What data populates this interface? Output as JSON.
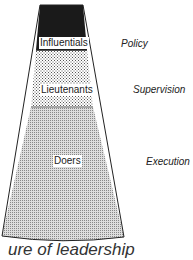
{
  "diagram": {
    "tiers": [
      {
        "label": "Influentials",
        "role": "Policy",
        "fill": "#1a1a1a"
      },
      {
        "label": "Lieutenants",
        "role": "Supervision",
        "fill": "dotted"
      },
      {
        "label": "Doers",
        "role": "Execution",
        "fill": "grid"
      }
    ],
    "caption": "ure of leadership"
  }
}
